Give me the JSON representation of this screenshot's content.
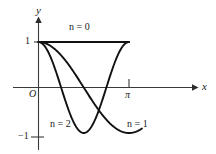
{
  "figure": {
    "axis_labels": {
      "x": "x",
      "y": "y",
      "origin": "O"
    },
    "tick_labels": {
      "y_one": "1",
      "y_negative_one": "−1",
      "x_pi": "π"
    },
    "curve_labels": {
      "n0": "n = 0",
      "n1": "n = 1",
      "n2": "n = 2"
    },
    "colors": {
      "ink": "#1a1a1a",
      "axis": "#3a3a3a",
      "background": "#ffffff"
    }
  },
  "chart_data": {
    "type": "line",
    "title": "",
    "subtitle": "",
    "xlabel": "x",
    "ylabel": "y",
    "xlim": [
      0,
      3.7699
    ],
    "ylim": [
      -1.25,
      1.35
    ],
    "grid": false,
    "legend": "inline-curve-labels",
    "x_ticks": [
      {
        "value": 3.14159,
        "label": "π"
      }
    ],
    "y_ticks": [
      {
        "value": 1,
        "label": "1"
      },
      {
        "value": -1,
        "label": "−1"
      }
    ],
    "origin_label": "O",
    "series": [
      {
        "name": "n = 0",
        "label": "n = 0",
        "formula": "y = cos(0·x) = 1",
        "x_range": [
          0,
          3.14159
        ],
        "points": [
          {
            "x": 0.0,
            "y": 1
          },
          {
            "x": 0.6283,
            "y": 1
          },
          {
            "x": 1.2566,
            "y": 1
          },
          {
            "x": 1.885,
            "y": 1
          },
          {
            "x": 2.5133,
            "y": 1
          },
          {
            "x": 3.14159,
            "y": 1
          }
        ]
      },
      {
        "name": "n = 1",
        "label": "n = 1",
        "formula": "y = cos(x)",
        "x_range": [
          0,
          3.59
        ],
        "points": [
          {
            "x": 0.0,
            "y": 1.0
          },
          {
            "x": 0.3927,
            "y": 0.924
          },
          {
            "x": 0.7854,
            "y": 0.707
          },
          {
            "x": 1.1781,
            "y": 0.383
          },
          {
            "x": 1.5708,
            "y": 0.0
          },
          {
            "x": 1.9635,
            "y": -0.383
          },
          {
            "x": 2.3562,
            "y": -0.707
          },
          {
            "x": 2.7489,
            "y": -0.924
          },
          {
            "x": 3.14159,
            "y": -1.0
          },
          {
            "x": 3.59,
            "y": -1.096
          }
        ]
      },
      {
        "name": "n = 2",
        "label": "n = 2",
        "formula": "y = cos(2x)",
        "x_range": [
          0,
          3.14159
        ],
        "points": [
          {
            "x": 0.0,
            "y": 1.0
          },
          {
            "x": 0.3927,
            "y": 0.707
          },
          {
            "x": 0.7854,
            "y": 0.0
          },
          {
            "x": 1.1781,
            "y": -0.707
          },
          {
            "x": 1.5708,
            "y": -1.0
          },
          {
            "x": 1.9635,
            "y": -0.707
          },
          {
            "x": 2.3562,
            "y": 0.0
          },
          {
            "x": 2.7489,
            "y": 0.707
          },
          {
            "x": 3.14159,
            "y": 1.0
          }
        ]
      }
    ]
  }
}
